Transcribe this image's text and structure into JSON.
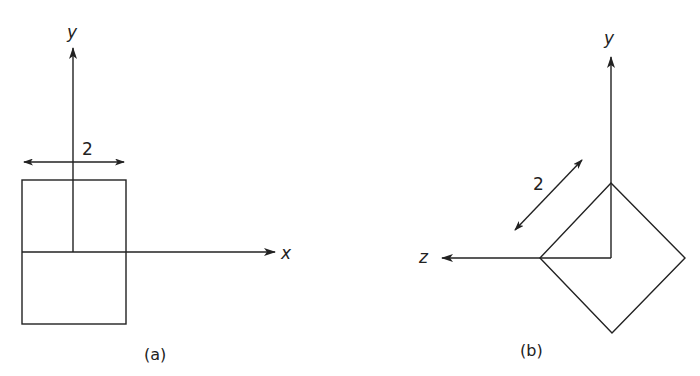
{
  "figure_a": {
    "caption": "(a)",
    "y_axis_label": "y",
    "x_axis_label": "x",
    "dimension_label": "2",
    "shape": "rectangle (front view)"
  },
  "figure_b": {
    "caption": "(b)",
    "y_axis_label": "y",
    "z_axis_label": "z",
    "dimension_label": "2",
    "shape": "square rotated 45 degrees (side view)"
  },
  "colors": {
    "stroke": "#222222",
    "background": "#ffffff"
  }
}
